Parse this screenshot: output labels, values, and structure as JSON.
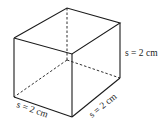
{
  "figure": {
    "type": "rectangular prism (cube) with hidden edges dashed",
    "labels": {
      "height": "s = 2 cm",
      "front_width": "s = 2 cm",
      "depth": "s = 2 cm"
    }
  }
}
